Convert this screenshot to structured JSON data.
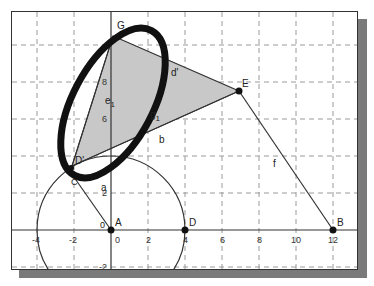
{
  "canvas": {
    "background": "#ffffff",
    "grid_color": "#9a9a9a",
    "polygon_fill": "#c8c8c8",
    "line_color": "#333333",
    "ellipse_color": "#111111"
  },
  "axes": {
    "x_ticks": [
      "-4",
      "-2",
      "0",
      "2",
      "4",
      "6",
      "8",
      "10",
      "12"
    ],
    "y_ticks": [
      "-2",
      "2",
      "4",
      "6",
      "8",
      "10"
    ]
  },
  "points": {
    "A": {
      "label": "A",
      "x": 0,
      "y": 0
    },
    "B": {
      "label": "B",
      "x": 12,
      "y": 0
    },
    "C": {
      "label": "C",
      "x": -2.3,
      "y": 3.3
    },
    "D": {
      "label": "D",
      "x": 4,
      "y": 0
    },
    "D_prime": {
      "label": "D'",
      "x": -2.1,
      "y": 3.5
    },
    "E": {
      "label": "E",
      "x": 6.9,
      "y": 7.5
    },
    "G": {
      "label": "G",
      "x": 0.1,
      "y": 10.5
    }
  },
  "segments": {
    "a": "a",
    "b": "b",
    "d_prime": "d'",
    "e1": "e1",
    "f": "f",
    "g1": "g1"
  },
  "labels": {
    "A": "A",
    "B": "B",
    "C": "C",
    "D": "D",
    "D_prime": "D'",
    "E": "E",
    "G": "G",
    "a": "a",
    "b": "b",
    "d_prime": "d'",
    "e": "e",
    "e_sub": "1",
    "f": "f",
    "g": "g",
    "g_sub": "1",
    "zero_label": "0"
  },
  "circle": {
    "center": "A",
    "radius": 4
  }
}
